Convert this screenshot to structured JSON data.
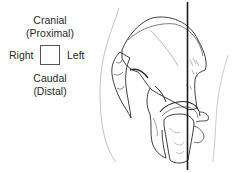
{
  "orientation_legend": {
    "top_label": "Cranial",
    "top_sublabel": "(Proximal)",
    "left_label": "Right",
    "right_label": "Left",
    "bottom_label": "Caudal",
    "bottom_sublabel": "(Distal)"
  },
  "illustration": {
    "subject": "pelvis-and-hip-joint",
    "reference_line": "vertical-line",
    "line_color": "#1a1a1a",
    "sketch_color": "#2a2a2a"
  }
}
